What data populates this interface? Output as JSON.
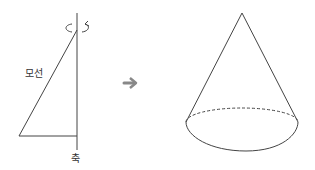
{
  "labels": {
    "generatrix": "모선",
    "axis": "축"
  },
  "icons": {
    "rotation": "rotation-arrow-icon",
    "transform": "right-arrow-icon"
  },
  "colors": {
    "stroke": "#444444",
    "arrow": "#888888"
  }
}
